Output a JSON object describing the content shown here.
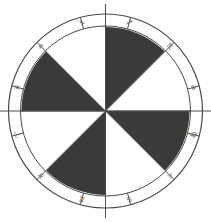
{
  "figure": {
    "name": "zodiac-wheel-diagram",
    "title": "",
    "background_color": "#ffffff",
    "line_color": "#4a4a48",
    "dark_fill": "#3a3a38",
    "light_fill": "#ffffff",
    "label_color": "#5a5a58"
  },
  "geometry": {
    "center_x": 105.5,
    "center_y": 111,
    "outer_radius": 97,
    "inner_radius": 85,
    "wedge_radius": 84,
    "segment_count": 12,
    "wedge_count": 8,
    "wedge_span_degrees": 45,
    "ring_span_degrees": 30,
    "ring_offset_degrees": -15
  },
  "chart_data": {
    "type": "pie",
    "categories": [
      "sector-1",
      "sector-2",
      "sector-3",
      "sector-4",
      "sector-5",
      "sector-6",
      "sector-7",
      "sector-8"
    ],
    "values": [
      45,
      45,
      45,
      45,
      45,
      45,
      45,
      45
    ],
    "start_angle_deg": -90,
    "direction": "clockwise",
    "series": [
      {
        "name": "fill-pattern",
        "values": [
          "dark",
          "light",
          "dark",
          "light",
          "dark",
          "light",
          "dark",
          "light"
        ]
      }
    ],
    "legend": "none",
    "grid": false,
    "annotations": [
      "Outer annulus divided into 12 equal zodiac houses",
      "Inner disc divided into 8 equal wedges, alternating black and white",
      "Horizontal and vertical axis lines cross the whole figure"
    ]
  },
  "ring": {
    "segments": [
      {
        "index": 0,
        "name": "sagittarius",
        "glyph": "♐",
        "label": "Sagittarius",
        "center_angle_deg": -75
      },
      {
        "index": 1,
        "name": "scorpio",
        "glyph": "♏",
        "label": "Scorpio",
        "center_angle_deg": -45
      },
      {
        "index": 2,
        "name": "libra",
        "glyph": "♎",
        "label": "Libra",
        "center_angle_deg": -15
      },
      {
        "index": 3,
        "name": "virgo",
        "glyph": "♍",
        "label": "Virgo",
        "center_angle_deg": 15
      },
      {
        "index": 4,
        "name": "leo",
        "glyph": "♌",
        "label": "Leo",
        "center_angle_deg": 45
      },
      {
        "index": 5,
        "name": "cancer",
        "glyph": "♋",
        "label": "Cancer",
        "center_angle_deg": 75
      },
      {
        "index": 6,
        "name": "gemini",
        "glyph": "♊",
        "label": "Gemini",
        "center_angle_deg": 105
      },
      {
        "index": 7,
        "name": "taurus",
        "glyph": "♉",
        "label": "Taurus",
        "center_angle_deg": 135
      },
      {
        "index": 8,
        "name": "aries",
        "glyph": "♈",
        "label": "Aries",
        "center_angle_deg": 165
      },
      {
        "index": 9,
        "name": "pisces",
        "glyph": "♓",
        "label": "Pisces",
        "center_angle_deg": 195
      },
      {
        "index": 10,
        "name": "aquarius",
        "glyph": "♒",
        "label": "Aquarius",
        "center_angle_deg": 225
      },
      {
        "index": 11,
        "name": "capricorn",
        "glyph": "♑",
        "label": "Capricorn",
        "center_angle_deg": 255
      }
    ]
  },
  "wedges": [
    {
      "index": 0,
      "name": "wedge-n-ne",
      "fill": "dark",
      "start_deg": -90,
      "end_deg": -45
    },
    {
      "index": 1,
      "name": "wedge-ne-e",
      "fill": "light",
      "start_deg": -45,
      "end_deg": 0
    },
    {
      "index": 2,
      "name": "wedge-e-se",
      "fill": "dark",
      "start_deg": 0,
      "end_deg": 45
    },
    {
      "index": 3,
      "name": "wedge-se-s",
      "fill": "light",
      "start_deg": 45,
      "end_deg": 90
    },
    {
      "index": 4,
      "name": "wedge-s-sw",
      "fill": "dark",
      "start_deg": 90,
      "end_deg": 135
    },
    {
      "index": 5,
      "name": "wedge-sw-w",
      "fill": "light",
      "start_deg": 135,
      "end_deg": 180
    },
    {
      "index": 6,
      "name": "wedge-w-nw",
      "fill": "dark",
      "start_deg": 180,
      "end_deg": 225
    },
    {
      "index": 7,
      "name": "wedge-nw-n",
      "fill": "light",
      "start_deg": 225,
      "end_deg": 270
    }
  ]
}
